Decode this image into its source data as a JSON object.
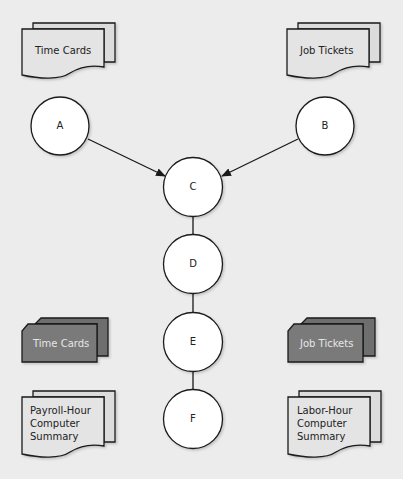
{
  "colors": {
    "background": "#ececec",
    "document_fill": "#e4e4e4",
    "document_back_fill": "#dcdcdc",
    "dark_card_fill": "#7a7a7a",
    "dark_card_back_fill": "#6e6e6e",
    "circle_fill": "#ffffff",
    "stroke": "#1a1a1a"
  },
  "documents": {
    "time_cards_top": {
      "label": "Time Cards",
      "shape": "multi-document"
    },
    "job_tickets_top": {
      "label": "Job Tickets",
      "shape": "multi-document"
    },
    "time_cards_bottom": {
      "label": "Time Cards",
      "shape": "punched-card-deck"
    },
    "job_tickets_bottom": {
      "label": "Job Tickets",
      "shape": "punched-card-deck"
    },
    "payroll_summary": {
      "lines": [
        "Payroll-Hour",
        "Computer",
        "Summary"
      ],
      "shape": "multi-document"
    },
    "labor_summary": {
      "lines": [
        "Labor-Hour",
        "Computer",
        "Summary"
      ],
      "shape": "multi-document"
    }
  },
  "nodes": [
    {
      "id": "A",
      "label": "A"
    },
    {
      "id": "B",
      "label": "B"
    },
    {
      "id": "C",
      "label": "C"
    },
    {
      "id": "D",
      "label": "D"
    },
    {
      "id": "E",
      "label": "E"
    },
    {
      "id": "F",
      "label": "F"
    }
  ],
  "edges": [
    {
      "from": "A",
      "to": "C",
      "arrow": true
    },
    {
      "from": "B",
      "to": "C",
      "arrow": true
    },
    {
      "from": "C",
      "to": "D",
      "arrow": false
    },
    {
      "from": "D",
      "to": "E",
      "arrow": false
    },
    {
      "from": "E",
      "to": "F",
      "arrow": false
    }
  ]
}
